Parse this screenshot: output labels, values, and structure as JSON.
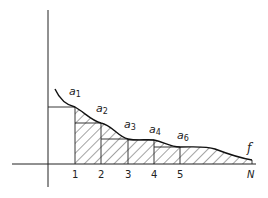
{
  "diagram": {
    "type": "step-approximation-under-curve",
    "curve_label": "f",
    "x_axis": {
      "ticks": [
        "1",
        "2",
        "3",
        "4",
        "5",
        "N"
      ]
    },
    "points": [
      {
        "base": "a",
        "sub": "1"
      },
      {
        "base": "a",
        "sub": "2"
      },
      {
        "base": "a",
        "sub": "3"
      },
      {
        "base": "a",
        "sub": "4"
      },
      {
        "base": "a",
        "sub": "6"
      }
    ],
    "colors": {
      "line": "#222222",
      "hatch": "#333333",
      "background": "#ffffff"
    }
  }
}
